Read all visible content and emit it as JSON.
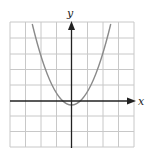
{
  "figure": {
    "type": "graph",
    "x_axis_label": "x",
    "y_axis_label": "y",
    "function": "y = x^2 - 2",
    "grid": {
      "columns": 8,
      "rows": 8,
      "x_range": [
        -4,
        4
      ],
      "y_range": [
        -3,
        5
      ]
    },
    "colors": {
      "grid": "#c8c8c8",
      "axis": "#222222",
      "curve": "#8a8a8a"
    }
  }
}
